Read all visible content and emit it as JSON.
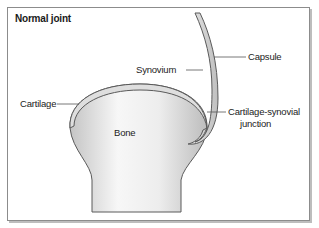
{
  "figure": {
    "title": "Normal joint",
    "labels": {
      "capsule": "Capsule",
      "synovium": "Synovium",
      "cartilage": "Cartilage",
      "bone": "Bone",
      "junction_line1": "Cartilage-synovial",
      "junction_line2": "junction"
    },
    "colors": {
      "frame_border": "#8c8c8c",
      "bone_fill_light": "#f4f4f4",
      "bone_fill_dark": "#c9c9c9",
      "outline": "#5a5a5a",
      "cartilage_fill": "#dcdcdc",
      "leader_line": "#555555"
    }
  }
}
